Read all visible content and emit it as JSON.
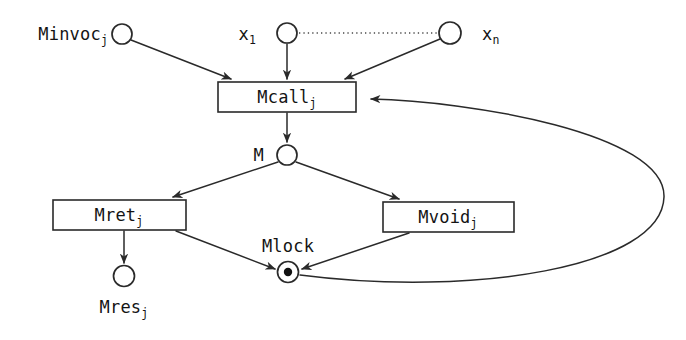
{
  "diagram": {
    "type": "petri-net",
    "title": "",
    "canvas": {
      "width": 686,
      "height": 340,
      "background": "#ffffff"
    },
    "stroke_color": "#2a2a2a",
    "text_color": "#141414",
    "places": [
      {
        "id": "minvoc",
        "base": "Minvoc",
        "sub": "j",
        "label": "Minvoc_j",
        "cx": 122,
        "cy": 34,
        "r": 10,
        "tokens": 0,
        "label_x": 108,
        "label_y": 40,
        "label_anchor": "end"
      },
      {
        "id": "x1",
        "base": "x",
        "sub": "1",
        "label": "x_1",
        "cx": 287,
        "cy": 33,
        "r": 10,
        "tokens": 0,
        "label_x": 256,
        "label_y": 40,
        "label_anchor": "end"
      },
      {
        "id": "xn",
        "base": "x",
        "sub": "n",
        "label": "x_n",
        "cx": 450,
        "cy": 33,
        "r": 11,
        "tokens": 0,
        "label_x": 482,
        "label_y": 40,
        "label_anchor": "start"
      },
      {
        "id": "m",
        "base": "M",
        "sub": "",
        "label": "M",
        "cx": 287,
        "cy": 155,
        "r": 10,
        "tokens": 0,
        "label_x": 264,
        "label_y": 161,
        "label_anchor": "end"
      },
      {
        "id": "mlock",
        "base": "Mlock",
        "sub": "",
        "label": "Mlock",
        "cx": 288,
        "cy": 272,
        "r": 10.5,
        "tokens": 1,
        "label_x": 288,
        "label_y": 252,
        "label_anchor": "middle"
      },
      {
        "id": "mres",
        "base": "Mres",
        "sub": "j",
        "label": "Mres_j",
        "cx": 124,
        "cy": 276,
        "r": 10.5,
        "tokens": 0,
        "label_x": 124,
        "label_y": 312,
        "label_anchor": "middle"
      }
    ],
    "transitions": [
      {
        "id": "mcall",
        "base": "Mcall",
        "sub": "j",
        "label": "Mcall_j",
        "x": 218,
        "y": 82,
        "width": 138,
        "height": 30,
        "text_x": 287,
        "text_y": 103
      },
      {
        "id": "mret",
        "base": "Mret",
        "sub": "j",
        "label": "Mret_j",
        "x": 53,
        "y": 200,
        "width": 133,
        "height": 30,
        "text_x": 119,
        "text_y": 221
      },
      {
        "id": "mvoid",
        "base": "Mvoid",
        "sub": "j",
        "label": "Mvoid_j",
        "x": 383,
        "y": 202,
        "width": 131,
        "height": 30,
        "text_x": 448,
        "text_y": 223
      }
    ],
    "arcs": [
      {
        "id": "arc-minvoc-mcall",
        "from": "minvoc",
        "to": "mcall",
        "style": "solid",
        "path": "M 131 40 L 231 79"
      },
      {
        "id": "arc-x1-mcall",
        "from": "x1",
        "to": "mcall",
        "style": "solid",
        "path": "M 287 44 L 287 79"
      },
      {
        "id": "arc-xn-mcall",
        "from": "xn",
        "to": "mcall",
        "style": "solid",
        "path": "M 440 39 L 344 79"
      },
      {
        "id": "arc-mcall-m",
        "from": "mcall",
        "to": "m",
        "style": "solid",
        "path": "M 287 113 L 287 143"
      },
      {
        "id": "arc-m-mret",
        "from": "m",
        "to": "mret",
        "style": "solid",
        "path": "M 278 162 L 172 197"
      },
      {
        "id": "arc-m-mvoid",
        "from": "m",
        "to": "mvoid",
        "style": "solid",
        "path": "M 296 162 L 400 199"
      },
      {
        "id": "arc-mret-mres",
        "from": "mret",
        "to": "mres",
        "style": "solid",
        "path": "M 124 231 L 124 263"
      },
      {
        "id": "arc-mret-mlock",
        "from": "mret",
        "to": "mlock",
        "style": "solid",
        "path": "M 176 231 L 275 269"
      },
      {
        "id": "arc-mvoid-mlock",
        "from": "mvoid",
        "to": "mlock",
        "style": "solid",
        "path": "M 408 233 L 301 269"
      },
      {
        "id": "arc-mlock-mcall",
        "from": "mlock",
        "to": "mcall",
        "style": "solid-curve",
        "path": "M 299 276 C 460 296 660 265 664 196 C 668 130 470 101 370 99"
      },
      {
        "id": "arc-x1-xn-ellipsis",
        "from": "x1",
        "to": "xn",
        "style": "dotted",
        "path": "M 299 33 L 438 33"
      }
    ]
  }
}
